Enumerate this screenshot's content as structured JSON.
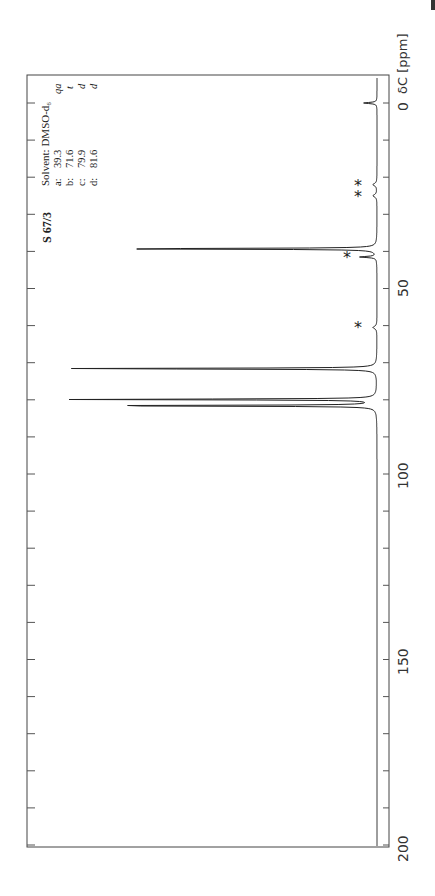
{
  "sample": {
    "id": "S 67/3"
  },
  "solvent_label": "Solvent: DMSO-d₆",
  "assignments": [
    {
      "label": "a:",
      "shift": "39.3",
      "mult": "qa"
    },
    {
      "label": "b:",
      "shift": "71.6",
      "mult": "t"
    },
    {
      "label": "c:",
      "shift": "79.9",
      "mult": "d"
    },
    {
      "label": "d:",
      "shift": "81.6",
      "mult": "d"
    }
  ],
  "axis": {
    "title": "δC [ppm]",
    "zero_label": "0",
    "tick_labels": [
      "50",
      "100",
      "150",
      "200"
    ]
  },
  "chart_data": {
    "type": "line",
    "subtitle": "Solvent: DMSO-d6",
    "xlabel": "δC [ppm]",
    "ylabel": "",
    "xlim": [
      0,
      200
    ],
    "x_reversed": false,
    "orientation": "rotated -90deg (ppm axis vertical, 0 at top)",
    "major_ticks": [
      0,
      50,
      100,
      150,
      200
    ],
    "minor_tick_step": 10,
    "grid": false,
    "peaks": [
      {
        "ppm": 0.0,
        "rel_intensity": 0.04,
        "note": "TMS reference"
      },
      {
        "ppm": 39.3,
        "rel_intensity": 0.86,
        "label": "a",
        "multiplicity": "qa"
      },
      {
        "ppm": 41.5,
        "rel_intensity": 0.05,
        "note": "solvent multiplet *"
      },
      {
        "ppm": 71.6,
        "rel_intensity": 1.0,
        "label": "b",
        "multiplicity": "t"
      },
      {
        "ppm": 79.9,
        "rel_intensity": 0.94,
        "label": "c",
        "multiplicity": "d"
      },
      {
        "ppm": 81.6,
        "rel_intensity": 0.95,
        "label": "d",
        "multiplicity": "d"
      }
    ],
    "artifact_markers": [
      {
        "ppm": 22.0,
        "symbol": "*"
      },
      {
        "ppm": 25.0,
        "symbol": "*"
      },
      {
        "ppm": 41.5,
        "symbol": "*"
      },
      {
        "ppm": 60.5,
        "symbol": "*"
      }
    ]
  }
}
